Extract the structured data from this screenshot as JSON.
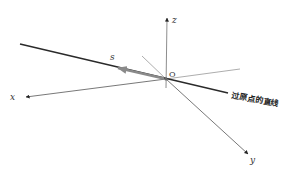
{
  "diagram": {
    "title": "",
    "labels": {
      "x_axis": "x",
      "y_axis": "y",
      "z_axis": "z",
      "origin": "O",
      "vector": "s",
      "line": "过原点的直线"
    },
    "colors": {
      "axis": "#707070",
      "line": "#2a2a2a",
      "vector": "#8a8a8a",
      "background": "#ffffff"
    },
    "geometry": {
      "origin": [
        166,
        79
      ],
      "x_axis_tip": [
        26,
        97
      ],
      "x_axis_back": [
        240,
        69
      ],
      "y_axis_tip": [
        248,
        154
      ],
      "y_axis_back": [
        142,
        56
      ],
      "z_axis_tip": [
        168,
        17
      ],
      "z_axis_bottom": [
        166,
        88
      ],
      "line_start": [
        20,
        44
      ],
      "line_end": [
        228,
        93
      ],
      "vector_tip": [
        117,
        68
      ]
    }
  }
}
